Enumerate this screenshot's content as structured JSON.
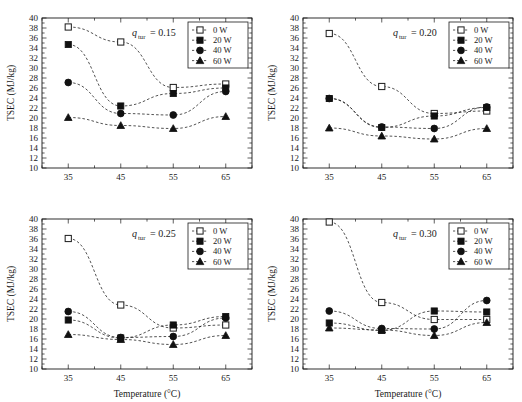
{
  "figure": {
    "panel_count": 4,
    "marker_legend": [
      "open-square",
      "filled-square",
      "filled-circle",
      "filled-triangle"
    ]
  },
  "axes": {
    "xlabel": "Temperature (°C)",
    "ylabel": "TSEC (MJ/kg)",
    "xticks": [
      "35",
      "45",
      "55",
      "65"
    ],
    "yticks": [
      "10",
      "12",
      "14",
      "16",
      "18",
      "20",
      "22",
      "24",
      "26",
      "28",
      "30",
      "32",
      "34",
      "36",
      "38",
      "40"
    ],
    "xlim": [
      30,
      70
    ],
    "ylim": [
      10,
      40
    ]
  },
  "legend": {
    "entries": [
      {
        "label": "0 W",
        "marker": "open-square"
      },
      {
        "label": "20 W",
        "marker": "filled-square"
      },
      {
        "label": "40 W",
        "marker": "filled-circle"
      },
      {
        "label": "60 W",
        "marker": "filled-triangle"
      }
    ]
  },
  "panels": [
    {
      "id": "panel-a",
      "title_var": "q",
      "title_sub": "tur",
      "title_eq": "= 0.15"
    },
    {
      "id": "panel-b",
      "title_var": "q",
      "title_sub": "tur",
      "title_eq": "= 0.20"
    },
    {
      "id": "panel-c",
      "title_var": "q",
      "title_sub": "tur",
      "title_eq": "= 0.25"
    },
    {
      "id": "panel-d",
      "title_var": "q",
      "title_sub": "tur",
      "title_eq": "= 0.30"
    }
  ],
  "chart_data": [
    {
      "type": "line",
      "title": "q_tur = 0.15",
      "xlabel": "Temperature (°C)",
      "ylabel": "TSEC (MJ/kg)",
      "x": [
        35,
        45,
        55,
        65
      ],
      "xlim": [
        30,
        70
      ],
      "ylim": [
        10,
        40
      ],
      "grid": false,
      "legend_position": "top-right",
      "series": [
        {
          "name": "0 W",
          "marker": "open-square",
          "values": [
            38.2,
            35.2,
            26.1,
            26.8
          ]
        },
        {
          "name": "20 W",
          "marker": "filled-square",
          "values": [
            34.7,
            22.4,
            24.9,
            26.0
          ]
        },
        {
          "name": "40 W",
          "marker": "filled-circle",
          "values": [
            27.1,
            20.9,
            20.6,
            25.3
          ]
        },
        {
          "name": "60 W",
          "marker": "filled-triangle",
          "values": [
            20.1,
            18.5,
            17.9,
            20.3
          ]
        }
      ]
    },
    {
      "type": "line",
      "title": "q_tur = 0.20",
      "xlabel": "Temperature (°C)",
      "ylabel": "TSEC (MJ/kg)",
      "x": [
        35,
        45,
        55,
        65
      ],
      "xlim": [
        30,
        70
      ],
      "ylim": [
        10,
        40
      ],
      "grid": false,
      "legend_position": "top-right",
      "series": [
        {
          "name": "0 W",
          "marker": "open-square",
          "values": [
            36.9,
            26.3,
            20.9,
            21.4
          ]
        },
        {
          "name": "20 W",
          "marker": "filled-square",
          "values": [
            23.9,
            18.1,
            20.4,
            22.1
          ]
        },
        {
          "name": "40 W",
          "marker": "filled-circle",
          "values": [
            23.9,
            18.2,
            17.9,
            22.2
          ]
        },
        {
          "name": "60 W",
          "marker": "filled-triangle",
          "values": [
            18.0,
            16.4,
            15.8,
            17.9
          ]
        }
      ]
    },
    {
      "type": "line",
      "title": "q_tur = 0.25",
      "xlabel": "Temperature (°C)",
      "ylabel": "TSEC (MJ/kg)",
      "x": [
        35,
        45,
        55,
        65
      ],
      "xlim": [
        30,
        70
      ],
      "ylim": [
        10,
        40
      ],
      "grid": false,
      "legend_position": "top-right",
      "series": [
        {
          "name": "0 W",
          "marker": "open-square",
          "values": [
            36.1,
            22.8,
            18.2,
            18.8
          ]
        },
        {
          "name": "20 W",
          "marker": "filled-square",
          "values": [
            19.8,
            16.2,
            18.8,
            20.5
          ]
        },
        {
          "name": "40 W",
          "marker": "filled-circle",
          "values": [
            21.5,
            16.3,
            16.5,
            20.2
          ]
        },
        {
          "name": "60 W",
          "marker": "filled-triangle",
          "values": [
            16.9,
            15.9,
            14.9,
            16.7
          ]
        }
      ]
    },
    {
      "type": "line",
      "title": "q_tur = 0.30",
      "xlabel": "Temperature (°C)",
      "ylabel": "TSEC (MJ/kg)",
      "x": [
        35,
        45,
        55,
        65
      ],
      "xlim": [
        30,
        70
      ],
      "ylim": [
        10,
        40
      ],
      "grid": false,
      "legend_position": "top-right",
      "series": [
        {
          "name": "0 W",
          "marker": "open-square",
          "values": [
            39.4,
            23.3,
            19.9,
            19.9
          ]
        },
        {
          "name": "20 W",
          "marker": "filled-square",
          "values": [
            19.2,
            17.7,
            21.6,
            21.4
          ]
        },
        {
          "name": "40 W",
          "marker": "filled-circle",
          "values": [
            21.6,
            18.1,
            18.0,
            23.7
          ]
        },
        {
          "name": "60 W",
          "marker": "filled-triangle",
          "values": [
            18.2,
            17.8,
            16.7,
            19.3
          ]
        }
      ]
    }
  ]
}
